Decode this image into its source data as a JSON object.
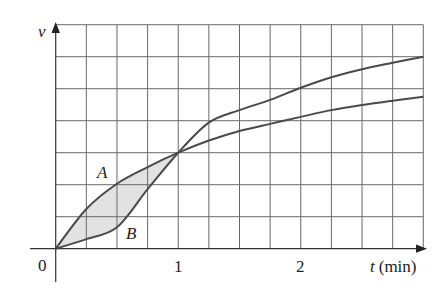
{
  "chart_data": {
    "type": "line",
    "title": "",
    "xlabel": "t (min)",
    "ylabel": "v",
    "x_tick_labels": [
      "0",
      "1",
      "2"
    ],
    "x_ticks": [
      0,
      1,
      2
    ],
    "xlim": [
      0,
      3
    ],
    "ylim": [
      0,
      7
    ],
    "grid": true,
    "grid_step_x": 0.25,
    "grid_step_y": 1,
    "legend": null,
    "annotations": [
      {
        "text": "A",
        "x": 0.4,
        "y": 2.4
      },
      {
        "text": "B",
        "x": 0.63,
        "y": 0.5
      }
    ],
    "shaded_region": {
      "between": [
        "A",
        "B"
      ],
      "x_range": [
        0,
        1
      ]
    },
    "x": [
      0,
      0.25,
      0.5,
      0.75,
      1,
      1.25,
      1.5,
      1.75,
      2,
      2.25,
      2.5,
      2.75,
      3
    ],
    "series": [
      {
        "name": "A",
        "values": [
          0,
          1.24,
          2.03,
          2.55,
          3.0,
          3.38,
          3.68,
          3.9,
          4.12,
          4.33,
          4.49,
          4.62,
          4.75
        ]
      },
      {
        "name": "B",
        "values": [
          0,
          0.3,
          0.67,
          1.86,
          3.0,
          3.94,
          4.33,
          4.65,
          5.03,
          5.36,
          5.61,
          5.81,
          6.0
        ]
      }
    ]
  },
  "labels": {
    "y_axis": "v",
    "x_axis_var": "t",
    "x_axis_unit": "(min)",
    "origin": "0",
    "tick_1": "1",
    "tick_2": "2",
    "curve_a": "A",
    "curve_b": "B"
  },
  "colors": {
    "grid": "#6a6a6a",
    "curve": "#4a4a4a",
    "shade": "#e2e2e2"
  }
}
